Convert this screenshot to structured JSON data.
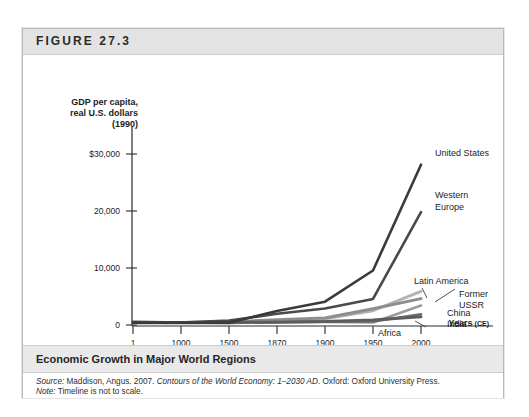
{
  "figure": {
    "number": "FIGURE 27.3",
    "caption": "Economic Growth in Major World Regions",
    "source_prefix": "Source:",
    "source_main": " Maddison, Angus. 2007. ",
    "source_title": "Contours of the World Economy: 1–2030 AD",
    "source_tail": ". Oxford: Oxford University Press.",
    "note_prefix": "Note:",
    "note_text": " Timeline is not to scale."
  },
  "chart_data": {
    "type": "line",
    "title": "Economic Growth in Major World Regions",
    "ylabel_lines": [
      "GDP per capita,",
      "real U.S. dollars",
      "(1990)"
    ],
    "xlabel": "Years",
    "xlabel_suffix": "(CE)",
    "grid": false,
    "legend_position": "inline-right-labels",
    "x": [
      1,
      1000,
      1500,
      1870,
      1900,
      1950,
      2000
    ],
    "xtick_labels": [
      "1",
      "1000",
      "1500",
      "1870",
      "1900",
      "1950",
      "2000"
    ],
    "ytick_labels": [
      "$30,000",
      "20,000",
      "10,000",
      "0"
    ],
    "ytick_values": [
      30000,
      20000,
      10000,
      0
    ],
    "ylim": [
      0,
      32000
    ],
    "note": "Timeline is not to scale; x-axis categories are evenly spaced.",
    "series": [
      {
        "name": "United States",
        "color": "#3a3a3a",
        "width": 2.6,
        "values": [
          400,
          400,
          400,
          2445,
          4091,
          9561,
          28129
        ]
      },
      {
        "name": "Western Europe",
        "color": "#4a4a4a",
        "width": 2.6,
        "values": [
          576,
          427,
          771,
          1960,
          2885,
          4579,
          19800
        ]
      },
      {
        "name": "Latin America",
        "color": "#b4b4b4",
        "width": 3.0,
        "values": [
          400,
          400,
          416,
          698,
          1113,
          2506,
          5889
        ]
      },
      {
        "name": "Former USSR",
        "color": "#8e8e8e",
        "width": 3.0,
        "values": [
          400,
          400,
          499,
          943,
          1237,
          2841,
          4626
        ]
      },
      {
        "name": "China",
        "color": "#9c9c9c",
        "width": 2.6,
        "values": [
          450,
          466,
          600,
          530,
          545,
          448,
          3421
        ]
      },
      {
        "name": "India",
        "color": "#6e6e6e",
        "width": 2.6,
        "values": [
          450,
          450,
          550,
          533,
          599,
          619,
          1892
        ]
      },
      {
        "name": "Africa",
        "color": "#5c5c5c",
        "width": 3.0,
        "values": [
          430,
          425,
          414,
          500,
          601,
          890,
          1447
        ]
      }
    ],
    "series_labels": [
      {
        "name": "United States",
        "lines": [
          "United States"
        ]
      },
      {
        "name": "Western Europe",
        "lines": [
          "Western",
          "Europe"
        ]
      },
      {
        "name": "Latin America",
        "lines": [
          "Latin America"
        ]
      },
      {
        "name": "Former USSR",
        "lines": [
          "Former",
          "USSR"
        ]
      },
      {
        "name": "China",
        "lines": [
          "China"
        ]
      },
      {
        "name": "India",
        "lines": [
          "India"
        ]
      },
      {
        "name": "Africa",
        "lines": [
          "Africa"
        ]
      }
    ]
  }
}
